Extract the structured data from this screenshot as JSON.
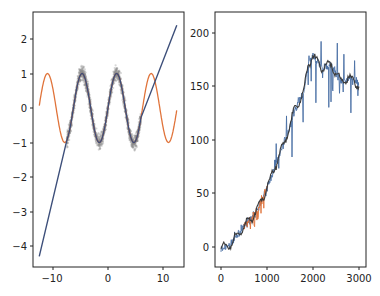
{
  "chart_data": [
    {
      "type": "line",
      "title": "",
      "xlabel": "",
      "ylabel": "",
      "xlim": [
        -14,
        14
      ],
      "ylim": [
        -4.6,
        2.8
      ],
      "grid": false,
      "legend": null,
      "xticks": [
        "−10",
        "0",
        "10"
      ],
      "xtick_values": [
        -10,
        0,
        10
      ],
      "yticks": [
        "−4",
        "−3",
        "−2",
        "−1",
        "0",
        "1",
        "2"
      ],
      "ytick_values": [
        -4,
        -3,
        -2,
        -1,
        0,
        1,
        2
      ],
      "series": [
        {
          "name": "sin(x) full range",
          "color": "#e0733a",
          "x_range": [
            -12.5,
            12.5
          ],
          "function": "sin(x)"
        },
        {
          "name": "noisy samples",
          "color": "#8c8c8c",
          "style": "scatter-band",
          "x_range": [
            -7.5,
            6.0
          ],
          "function": "sin(x) + noise",
          "noise_amplitude": 0.35
        },
        {
          "name": "fit / piecewise",
          "color": "#3d4f7a",
          "points": [
            [
              -12.5,
              -4.3
            ],
            [
              -7.5,
              -0.95
            ],
            [
              -4.71,
              1.0
            ],
            [
              -1.57,
              -1.0
            ],
            [
              1.57,
              1.0
            ],
            [
              4.71,
              -1.0
            ],
            [
              6.0,
              0.3
            ],
            [
              12.5,
              2.4
            ]
          ]
        }
      ]
    },
    {
      "type": "line",
      "title": "",
      "xlabel": "",
      "ylabel": "",
      "xlim": [
        -150,
        3150
      ],
      "ylim": [
        -20,
        215
      ],
      "grid": false,
      "legend": null,
      "xticks": [
        "0",
        "1000",
        "2000",
        "3000"
      ],
      "xtick_values": [
        0,
        1000,
        2000,
        3000
      ],
      "yticks": [
        "0",
        "50",
        "100",
        "150",
        "200"
      ],
      "ytick_values": [
        0,
        50,
        100,
        150,
        200
      ],
      "series": [
        {
          "name": "raw signal",
          "color": "#4a6fa5",
          "points": [
            [
              0,
              -2
            ],
            [
              100,
              -5
            ],
            [
              200,
              3
            ],
            [
              300,
              8
            ],
            [
              400,
              15
            ],
            [
              500,
              20
            ],
            [
              600,
              25
            ],
            [
              700,
              30
            ],
            [
              800,
              38
            ],
            [
              900,
              47
            ],
            [
              1000,
              55
            ],
            [
              1100,
              70
            ],
            [
              1200,
              80
            ],
            [
              1300,
              95
            ],
            [
              1400,
              105
            ],
            [
              1500,
              120
            ],
            [
              1600,
              135
            ],
            [
              1700,
              130
            ],
            [
              1800,
              150
            ],
            [
              1900,
              175
            ],
            [
              2000,
              180
            ],
            [
              2100,
              170
            ],
            [
              2200,
              165
            ],
            [
              2300,
              170
            ],
            [
              2400,
              175
            ],
            [
              2500,
              160
            ],
            [
              2600,
              150
            ],
            [
              2700,
              155
            ],
            [
              2800,
              160
            ],
            [
              2900,
              155
            ],
            [
              3000,
              150
            ]
          ]
        },
        {
          "name": "early segment",
          "color": "#e0733a",
          "x_range": [
            500,
            1000
          ]
        },
        {
          "name": "smoothed",
          "color": "#3a3a3a",
          "points": [
            [
              0,
              -2
            ],
            [
              200,
              2
            ],
            [
              400,
              14
            ],
            [
              600,
              24
            ],
            [
              800,
              36
            ],
            [
              1000,
              55
            ],
            [
              1200,
              78
            ],
            [
              1400,
              100
            ],
            [
              1600,
              128
            ],
            [
              1800,
              145
            ],
            [
              1900,
              172
            ],
            [
              2000,
              178
            ],
            [
              2200,
              168
            ],
            [
              2400,
              170
            ],
            [
              2600,
              155
            ],
            [
              2800,
              158
            ],
            [
              3000,
              152
            ]
          ]
        }
      ]
    }
  ],
  "axes": {
    "left": {
      "xticks": [
        "−10",
        "0",
        "10"
      ],
      "yticks": [
        "−4",
        "−3",
        "−2",
        "−1",
        "0",
        "1",
        "2"
      ]
    },
    "right": {
      "xticks": [
        "0",
        "1000",
        "2000",
        "3000"
      ],
      "yticks": [
        "0",
        "50",
        "100",
        "150",
        "200"
      ]
    }
  },
  "colors": {
    "orange": "#e0733a",
    "blue": "#3d4f7a",
    "gray": "#8c8c8c",
    "dark": "#3a3a3a",
    "frame": "#222222"
  }
}
